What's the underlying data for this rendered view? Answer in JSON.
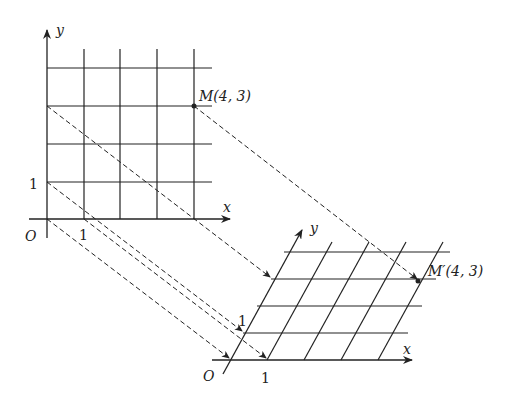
{
  "diagram": {
    "left_grid": {
      "axis_x_label": "x",
      "axis_y_label": "y",
      "origin_label": "O",
      "x_tick_label": "1",
      "y_tick_label": "1",
      "point_label": "M(4, 3)",
      "point": [
        4,
        3
      ],
      "grid_size": [
        5,
        4
      ]
    },
    "right_grid": {
      "axis_x_label": "x",
      "axis_y_label": "y",
      "origin_label": "O",
      "x_tick_label": "1",
      "y_tick_label": "1",
      "point_label": "M′(4, 3)",
      "point": [
        4,
        3
      ],
      "grid_size": [
        5,
        4
      ]
    },
    "projection_style": "dashed arrows",
    "line_color": "#222222"
  }
}
